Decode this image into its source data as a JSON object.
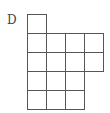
{
  "figure": {
    "label": "D",
    "shape": "grid polyomino",
    "cell_size_px": 18,
    "origin": {
      "x": 27,
      "y": 14
    },
    "line_color": "#555555",
    "rows": [
      {
        "row": 1,
        "filled_columns": [
          1
        ]
      },
      {
        "row": 2,
        "filled_columns": [
          1,
          2,
          3,
          4
        ]
      },
      {
        "row": 3,
        "filled_columns": [
          1,
          2,
          3,
          4
        ]
      },
      {
        "row": 4,
        "filled_columns": [
          1,
          2,
          3
        ]
      },
      {
        "row": 5,
        "filled_columns": [
          1,
          2,
          3
        ]
      }
    ],
    "total_cells": 15
  }
}
